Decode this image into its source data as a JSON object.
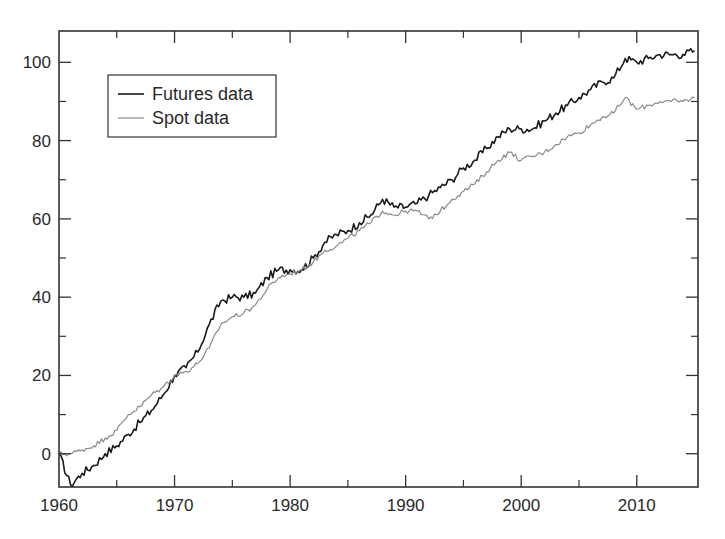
{
  "chart_data": {
    "type": "line",
    "title": "",
    "xlabel": "",
    "ylabel": "",
    "xlim": [
      1960,
      2015.3
    ],
    "ylim": [
      -8.5,
      108
    ],
    "grid": false,
    "legend_position": "upper left (inset)",
    "x_ticks": [
      1960,
      1970,
      1980,
      1990,
      2000,
      2010
    ],
    "x_minor_ticks": [
      1965,
      1975,
      1985,
      1995,
      2005
    ],
    "y_ticks": [
      0,
      20,
      40,
      60,
      80,
      100
    ],
    "y_minor_ticks": [
      10,
      30,
      50,
      70,
      90
    ],
    "x": [
      1960,
      1961,
      1962,
      1963,
      1964,
      1965,
      1966,
      1967,
      1968,
      1969,
      1970,
      1971,
      1972,
      1973,
      1974,
      1975,
      1976,
      1977,
      1978,
      1979,
      1980,
      1981,
      1982,
      1983,
      1984,
      1985,
      1986,
      1987,
      1988,
      1989,
      1990,
      1991,
      1992,
      1993,
      1994,
      1995,
      1996,
      1997,
      1998,
      1999,
      2000,
      2001,
      2002,
      2003,
      2004,
      2005,
      2006,
      2007,
      2008,
      2009,
      2010,
      2011,
      2012,
      2013,
      2014,
      2015
    ],
    "series": [
      {
        "name": "Futures data",
        "color": "#1a1a1a",
        "values": [
          0,
          -8,
          -5,
          -3,
          0,
          2,
          5,
          8,
          11,
          15,
          20,
          22,
          26,
          33,
          39,
          40,
          40,
          41,
          45,
          47,
          47,
          47,
          50,
          54,
          56,
          57,
          59,
          61,
          65,
          63,
          63,
          64,
          66,
          68,
          70,
          73,
          75,
          78,
          81,
          83,
          83,
          83,
          85,
          87,
          89,
          91,
          93,
          95,
          96,
          101,
          100,
          101,
          102,
          102,
          102,
          103
        ]
      },
      {
        "name": "Spot data",
        "color": "#8a8a8a",
        "values": [
          0,
          0,
          1,
          2,
          4,
          6,
          10,
          12,
          15,
          17,
          20,
          21,
          23,
          27,
          33,
          35,
          36,
          38,
          42,
          45,
          46,
          47,
          49,
          52,
          53,
          55,
          57,
          59,
          62,
          61,
          62,
          62,
          60,
          62,
          65,
          67,
          69,
          72,
          75,
          77,
          75,
          76,
          77,
          79,
          81,
          82,
          84,
          86,
          87,
          91,
          88,
          89,
          90,
          90,
          90,
          91
        ]
      }
    ]
  },
  "legend": {
    "items": [
      {
        "label": "Futures data",
        "color": "#1a1a1a"
      },
      {
        "label": "Spot data",
        "color": "#8a8a8a"
      }
    ]
  },
  "axes": {
    "x_labels": [
      "1960",
      "1970",
      "1980",
      "1990",
      "2000",
      "2010"
    ],
    "y_labels": [
      "0",
      "20",
      "40",
      "60",
      "80",
      "100"
    ]
  }
}
